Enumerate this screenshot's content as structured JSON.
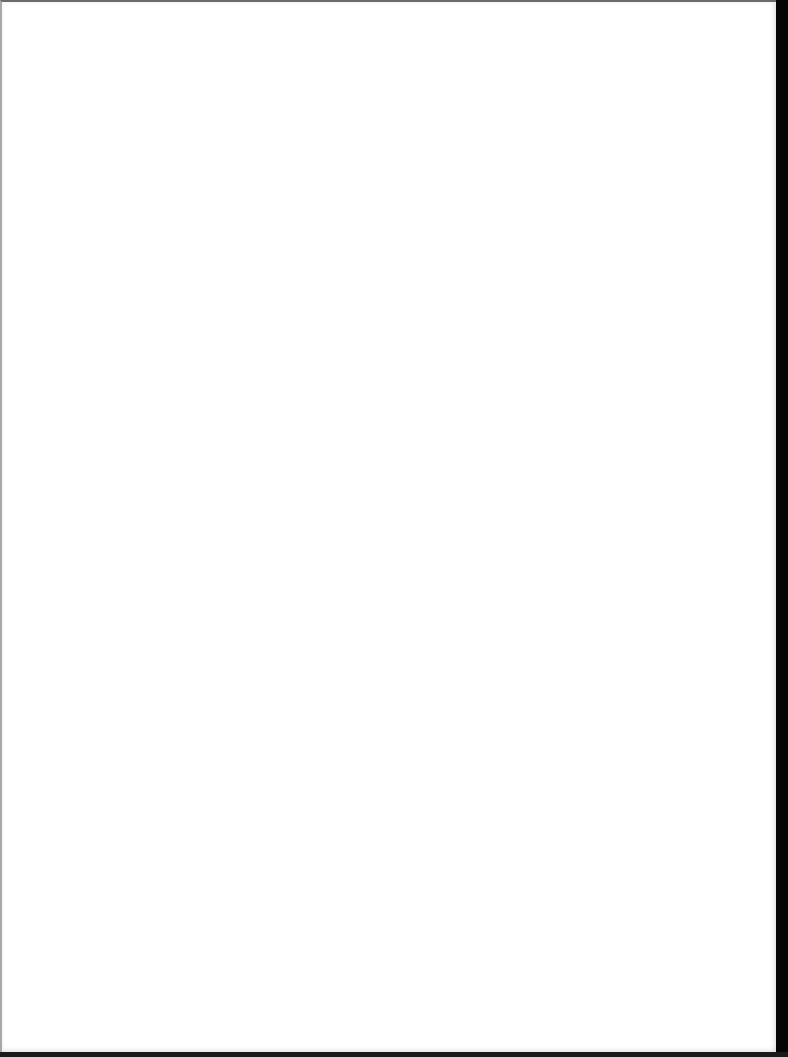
{
  "document": {
    "type": "scanned-page",
    "state": "blank",
    "colors": {
      "paper": "#ffffff",
      "scan_border": "#000000",
      "top_edge": "#6b6b6b",
      "left_edge": "#a8a8a8"
    },
    "text_content": ""
  }
}
